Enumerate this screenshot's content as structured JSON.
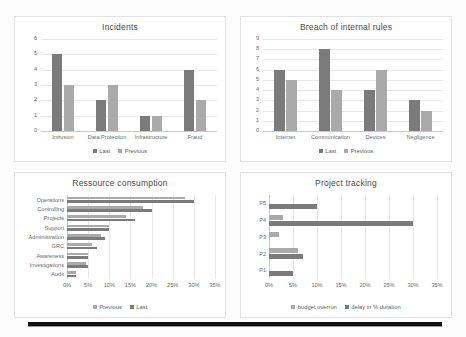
{
  "page": {
    "background": "#fdfdfd",
    "rule_color": "#111111"
  },
  "colors": {
    "last": "#7b7b7b",
    "previous": "#aaaaaa",
    "grid": "#e8e8e8",
    "axis": "#d0d0d0",
    "text": "#6b6b6b"
  },
  "panels": [
    {
      "id": "incidents",
      "title": "Incidents"
    },
    {
      "id": "breach",
      "title": "Breach of internal rules"
    },
    {
      "id": "ressource",
      "title": "Ressource consumption"
    },
    {
      "id": "project",
      "title": "Project tracking"
    }
  ],
  "chart_data": [
    {
      "type": "bar",
      "title": "Incidents",
      "orientation": "vertical",
      "categories": [
        "Intrusion",
        "Data Protection",
        "Infrastructure",
        "Fraud"
      ],
      "series": [
        {
          "name": "Last",
          "color": "#7b7b7b",
          "values": [
            5,
            2,
            1,
            4
          ]
        },
        {
          "name": "Previous",
          "color": "#aaaaaa",
          "values": [
            3,
            3,
            1,
            2
          ]
        }
      ],
      "yticks": [
        0,
        1,
        2,
        3,
        4,
        5,
        6
      ],
      "ylim": [
        0,
        6
      ],
      "xlabel": "",
      "ylabel": "",
      "grid": true,
      "legend_position": "bottom"
    },
    {
      "type": "bar",
      "title": "Breach of internal rules",
      "orientation": "vertical",
      "categories": [
        "Internet",
        "Communication",
        "Devices",
        "Negligence"
      ],
      "series": [
        {
          "name": "Last",
          "color": "#7b7b7b",
          "values": [
            6,
            8,
            4,
            3
          ]
        },
        {
          "name": "Previous",
          "color": "#aaaaaa",
          "values": [
            5,
            4,
            6,
            2
          ]
        }
      ],
      "yticks": [
        0,
        1,
        2,
        3,
        4,
        5,
        6,
        7,
        8,
        9
      ],
      "ylim": [
        0,
        9
      ],
      "xlabel": "",
      "ylabel": "",
      "grid": true,
      "legend_position": "bottom"
    },
    {
      "type": "bar",
      "title": "Ressource consumption",
      "orientation": "horizontal",
      "categories": [
        "Operations",
        "Controlling",
        "Projects",
        "Support",
        "Administration",
        "GRC",
        "Awareness",
        "Investigations",
        "Audit"
      ],
      "series": [
        {
          "name": "Previous",
          "color": "#aaaaaa",
          "values": [
            28,
            18,
            14,
            10,
            8,
            6,
            5,
            4.5,
            2
          ]
        },
        {
          "name": "Last",
          "color": "#7b7b7b",
          "values": [
            30,
            20,
            16,
            10,
            9,
            7,
            5,
            5,
            2
          ]
        }
      ],
      "xticks": [
        "0%",
        "5%",
        "10%",
        "15%",
        "20%",
        "25%",
        "30%",
        "35%"
      ],
      "xlim": [
        0,
        35
      ],
      "xlabel": "",
      "ylabel": "",
      "grid": true,
      "legend_position": "bottom"
    },
    {
      "type": "bar",
      "title": "Project tracking",
      "orientation": "horizontal",
      "categories": [
        "P5",
        "P4",
        "P3",
        "P2",
        "P1"
      ],
      "series": [
        {
          "name": "budget overrun",
          "color": "#aaaaaa",
          "values": [
            0,
            3,
            2,
            6,
            0
          ]
        },
        {
          "name": "delay in % duration",
          "color": "#7b7b7b",
          "values": [
            10,
            30,
            0,
            7,
            5
          ]
        }
      ],
      "xticks": [
        "0%",
        "5%",
        "10%",
        "15%",
        "20%",
        "25%",
        "30%",
        "35%"
      ],
      "xlim": [
        0,
        35
      ],
      "xlabel": "",
      "ylabel": "",
      "grid": true,
      "legend_position": "bottom"
    }
  ]
}
